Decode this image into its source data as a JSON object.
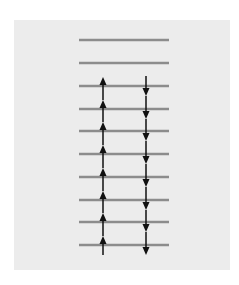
{
  "diagram": {
    "type": "energy-level-ladder",
    "levels": [
      {
        "index": 0,
        "y": 40
      },
      {
        "index": 1,
        "y": 63
      },
      {
        "index": 2,
        "y": 86
      },
      {
        "index": 3,
        "y": 109
      },
      {
        "index": 4,
        "y": 131
      },
      {
        "index": 5,
        "y": 154
      },
      {
        "index": 6,
        "y": 177
      },
      {
        "index": 7,
        "y": 200
      },
      {
        "index": 8,
        "y": 222
      },
      {
        "index": 9,
        "y": 245
      }
    ],
    "level_x_start": 79,
    "level_x_end": 169,
    "up_arrows": {
      "x": 103,
      "count": 8,
      "direction": "up"
    },
    "down_arrows": {
      "x": 146,
      "count": 8,
      "direction": "down"
    },
    "colors": {
      "background": "#ececec",
      "level_line": "#8c8c8c",
      "arrow": "#111111"
    }
  }
}
